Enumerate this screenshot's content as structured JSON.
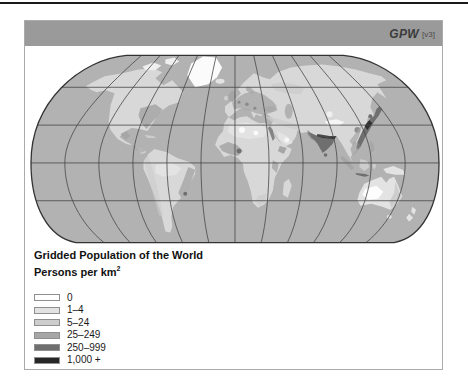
{
  "header": {
    "brand": "GPW",
    "version": "[v3]"
  },
  "legend": {
    "title": "Gridded Population of the World",
    "subtitle_text": "Persons per km",
    "subtitle_sup": "2",
    "items": [
      {
        "label": "0",
        "color": "#ffffff"
      },
      {
        "label": "1–4",
        "color": "#e3e3e3"
      },
      {
        "label": "5–24",
        "color": "#cdcdcd"
      },
      {
        "label": "25–249",
        "color": "#a6a6a6"
      },
      {
        "label": "250–999",
        "color": "#6f6f6f"
      },
      {
        "label": "1,000 +",
        "color": "#262626"
      }
    ]
  },
  "colors": {
    "top_rule": "#1a1a1a",
    "titlebar_bg": "#9a9a9a",
    "titlebar_text": "#3c3c3c",
    "frame_border": "#ababab",
    "ocean": "#b2b2b2",
    "land": "#d8d8d8",
    "graticule": "#474747",
    "map_outline": "#333333"
  }
}
